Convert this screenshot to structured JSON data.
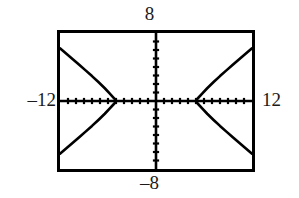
{
  "graph": {
    "labels": {
      "ymax": "8",
      "ymin": "–8",
      "xmin": "–12",
      "xmax": "12"
    },
    "colors": {
      "frame": "#000000",
      "axis": "#000000",
      "curve": "#000000",
      "background": "#ffffff"
    }
  },
  "chart_data": {
    "type": "line",
    "title": "",
    "xlabel": "",
    "ylabel": "",
    "xlim": [
      -12,
      12
    ],
    "ylim": [
      -8,
      8
    ],
    "grid": false,
    "legend": null,
    "axes": {
      "x_axis_at_y": 0,
      "y_axis_at_x": 0,
      "x_tick_interval": 1,
      "y_tick_interval": 1,
      "x_ticks": [
        -11,
        -10,
        -9,
        -8,
        -7,
        -6,
        -5,
        -4,
        -3,
        -2,
        -1,
        1,
        2,
        3,
        4,
        5,
        6,
        7,
        8,
        9,
        10,
        11
      ],
      "y_ticks": [
        -7,
        -6,
        -5,
        -4,
        -3,
        -2,
        -1,
        1,
        2,
        3,
        4,
        5,
        6,
        7
      ],
      "tick_style": "dotted-marks",
      "axis_labels_shown": [
        "8",
        "-8",
        "-12",
        "12"
      ]
    },
    "curve_description": "horizontal hyperbola, two branches opening left and right, vertices on the x-axis",
    "vertices": [
      [
        -5,
        0
      ],
      [
        5,
        0
      ]
    ],
    "series": [
      {
        "name": "hyperbola-left-upper",
        "points": [
          [
            -12,
            6.2
          ],
          [
            -11.2,
            5.56
          ],
          [
            -10.4,
            4.92
          ],
          [
            -9.6,
            4.27
          ],
          [
            -8.8,
            3.6
          ],
          [
            -8.0,
            2.93
          ],
          [
            -7.2,
            2.23
          ],
          [
            -6.4,
            1.5
          ],
          [
            -5.8,
            0.9
          ],
          [
            -5.35,
            0.44
          ],
          [
            -5.08,
            0.17
          ],
          [
            -5.0,
            0.0
          ]
        ]
      },
      {
        "name": "hyperbola-left-lower",
        "points": [
          [
            -5.0,
            0.0
          ],
          [
            -5.08,
            -0.17
          ],
          [
            -5.35,
            -0.44
          ],
          [
            -5.8,
            -0.9
          ],
          [
            -6.4,
            -1.5
          ],
          [
            -7.2,
            -2.23
          ],
          [
            -8.0,
            -2.93
          ],
          [
            -8.8,
            -3.6
          ],
          [
            -9.6,
            -4.27
          ],
          [
            -10.4,
            -4.92
          ],
          [
            -11.2,
            -5.56
          ],
          [
            -12,
            -6.2
          ]
        ]
      },
      {
        "name": "hyperbola-right-upper",
        "points": [
          [
            5.0,
            0.0
          ],
          [
            5.08,
            0.17
          ],
          [
            5.35,
            0.44
          ],
          [
            5.8,
            0.9
          ],
          [
            6.4,
            1.5
          ],
          [
            7.2,
            2.23
          ],
          [
            8.0,
            2.93
          ],
          [
            8.8,
            3.6
          ],
          [
            9.6,
            4.27
          ],
          [
            10.4,
            4.92
          ],
          [
            11.2,
            5.56
          ],
          [
            12,
            6.2
          ]
        ]
      },
      {
        "name": "hyperbola-right-lower",
        "points": [
          [
            5.0,
            0.0
          ],
          [
            5.08,
            -0.17
          ],
          [
            5.35,
            -0.44
          ],
          [
            5.8,
            -0.9
          ],
          [
            6.4,
            -1.5
          ],
          [
            7.2,
            -2.23
          ],
          [
            8.0,
            -2.93
          ],
          [
            8.8,
            -3.6
          ],
          [
            9.6,
            -4.27
          ],
          [
            10.4,
            -4.92
          ],
          [
            11.2,
            -5.56
          ],
          [
            12,
            -6.2
          ]
        ]
      }
    ]
  }
}
